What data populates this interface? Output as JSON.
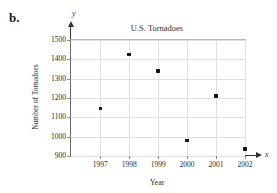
{
  "figure": {
    "label": "b."
  },
  "chart_data": {
    "type": "scatter",
    "title": "U.S. Tornadoes",
    "xlabel": "Year",
    "ylabel": "Number of Tornadoes",
    "x_axis_symbol": "x",
    "y_axis_symbol": "y",
    "categories": [
      "1997",
      "1998",
      "1999",
      "2000",
      "2001",
      "2002"
    ],
    "values": [
      1145,
      1425,
      1340,
      980,
      1210,
      935
    ],
    "ylim": [
      900,
      1500
    ],
    "yticks": [
      900,
      1000,
      1100,
      1200,
      1300,
      1400,
      1500
    ],
    "grid": true,
    "legend": "none",
    "colors": {
      "point": "#141414",
      "grid": "#e0e0e0",
      "axis": "#6a6a6a",
      "border": "#b8b8b8",
      "text": "#333333"
    }
  }
}
